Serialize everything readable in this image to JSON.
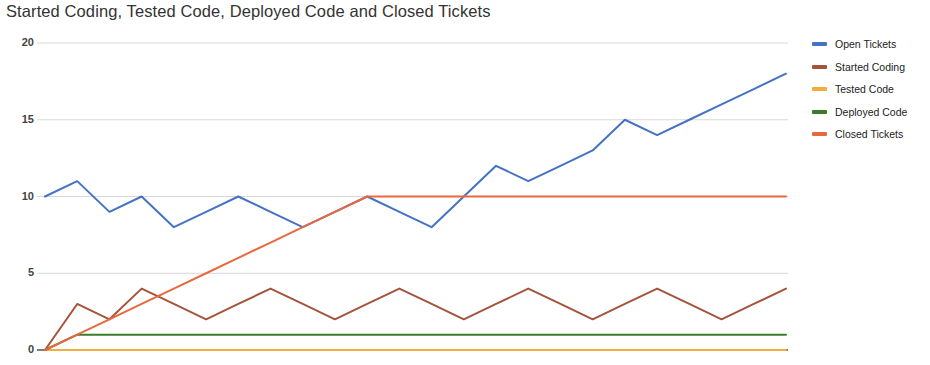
{
  "chart_data": {
    "type": "line",
    "title": "Started Coding, Tested Code, Deployed Code and Closed Tickets",
    "xlabel": "",
    "ylabel": "",
    "ylim": [
      0,
      20
    ],
    "yticks": [
      0,
      5,
      10,
      15,
      20
    ],
    "ytick_labels": [
      "0",
      "5",
      "10",
      "15",
      "20"
    ],
    "grid": true,
    "legend_position": "right",
    "x": [
      0,
      1,
      2,
      3,
      4,
      5,
      6,
      7,
      8,
      9,
      10,
      11,
      12,
      13,
      14,
      15,
      16,
      17,
      18,
      19,
      20,
      21,
      22,
      23
    ],
    "series": [
      {
        "name": "Open Tickets",
        "color": "#4472c4",
        "values": [
          10,
          11,
          9,
          10,
          8,
          9,
          10,
          9,
          8,
          9,
          10,
          9,
          8,
          10,
          12,
          11,
          12,
          13,
          15,
          14,
          15,
          16,
          17,
          18
        ]
      },
      {
        "name": "Started Coding",
        "color": "#a5543c",
        "values": [
          0,
          3,
          2,
          4,
          3,
          2,
          3,
          4,
          3,
          2,
          3,
          4,
          3,
          2,
          3,
          4,
          3,
          2,
          3,
          4,
          3,
          2,
          3,
          4
        ]
      },
      {
        "name": "Tested Code",
        "color": "#f1ad3e",
        "values": [
          0,
          0,
          0,
          0,
          0,
          0,
          0,
          0,
          0,
          0,
          0,
          0,
          0,
          0,
          0,
          0,
          0,
          0,
          0,
          0,
          0,
          0,
          0,
          0
        ]
      },
      {
        "name": "Deployed Code",
        "color": "#3b7d29",
        "values": [
          0,
          1,
          1,
          1,
          1,
          1,
          1,
          1,
          1,
          1,
          1,
          1,
          1,
          1,
          1,
          1,
          1,
          1,
          1,
          1,
          1,
          1,
          1,
          1
        ]
      },
      {
        "name": "Closed Tickets",
        "color": "#e8683f",
        "values": [
          0,
          1,
          2,
          3,
          4,
          5,
          6,
          7,
          8,
          9,
          10,
          10,
          10,
          10,
          10,
          10,
          10,
          10,
          10,
          10,
          10,
          10,
          10,
          10
        ]
      }
    ]
  },
  "legend": {
    "items": [
      {
        "label": "Open Tickets"
      },
      {
        "label": "Started Coding"
      },
      {
        "label": "Tested Code"
      },
      {
        "label": "Deployed Code"
      },
      {
        "label": "Closed Tickets"
      }
    ]
  },
  "axis": {
    "y_labels": [
      "20",
      "15",
      "10",
      "5",
      "0"
    ]
  }
}
